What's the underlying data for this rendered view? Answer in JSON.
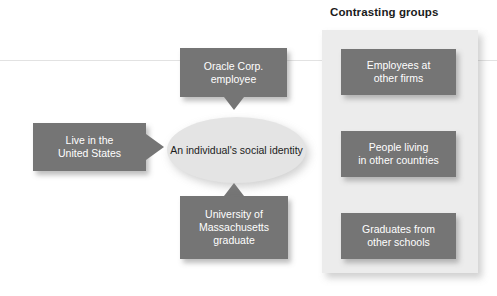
{
  "diagram": {
    "title": "Contrasting groups",
    "center": {
      "label": "An individual's\nsocial identity",
      "line1": "An individual's",
      "line2": "social identity"
    },
    "identity_boxes": [
      {
        "name": "oracle-employee",
        "line1": "Oracle Corp.",
        "line2": "employee",
        "tail": "down"
      },
      {
        "name": "live-united-states",
        "line1": "Live in the",
        "line2": "United States",
        "tail": "right"
      },
      {
        "name": "university-massachusetts",
        "line1": "University of",
        "line2": "Massachusetts",
        "line3": "graduate",
        "tail": "up"
      }
    ],
    "contrasting_boxes": [
      {
        "name": "employees-other-firms",
        "line1": "Employees at",
        "line2": "other firms"
      },
      {
        "name": "people-other-countries",
        "line1": "People living",
        "line2": "in other countries"
      },
      {
        "name": "graduates-other-schools",
        "line1": "Graduates from",
        "line2": "other schools"
      }
    ],
    "colors": {
      "box_fill": "#757575",
      "box_text": "#ffffff",
      "panel_fill": "#ececec",
      "ellipse_fill": "#e4e4e4",
      "ellipse_text": "#1c1c1c",
      "title_text": "#1b1b1b",
      "background": "#ffffff"
    }
  }
}
